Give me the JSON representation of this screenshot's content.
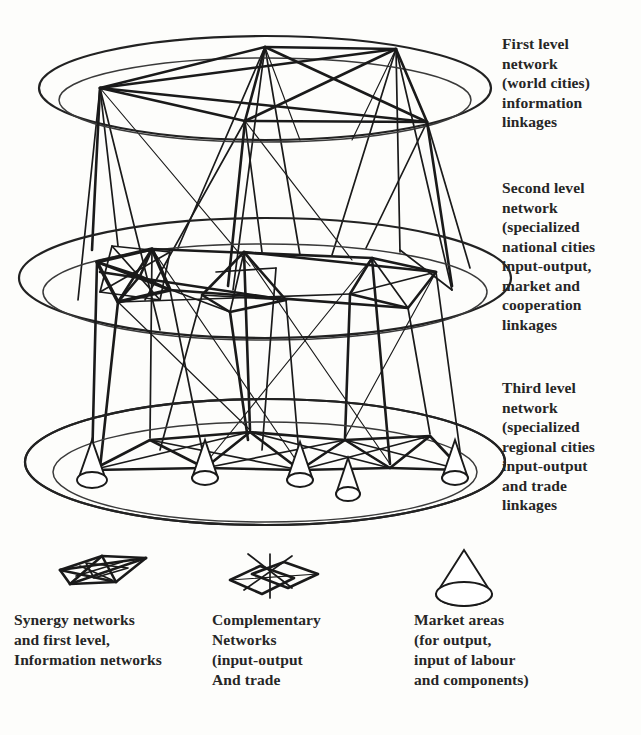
{
  "figure": {
    "background_color": "#fdfdfb",
    "ink_color": "#1a1a1a"
  },
  "levels": [
    {
      "id": "first",
      "label": "First level\nnetwork\n(world cities)\ninformation\nlinkages",
      "node_count": 5,
      "ellipse": {
        "cx": 265,
        "cy": 88,
        "rx": 226,
        "ry": 52
      },
      "nodes": [
        [
          100,
          88
        ],
        [
          265,
          47
        ],
        [
          396,
          49
        ],
        [
          245,
          121
        ],
        [
          427,
          122
        ]
      ],
      "edges": [
        [
          0,
          1
        ],
        [
          0,
          2
        ],
        [
          0,
          3
        ],
        [
          0,
          4
        ],
        [
          1,
          2
        ],
        [
          1,
          3
        ],
        [
          1,
          4
        ],
        [
          2,
          3
        ],
        [
          2,
          4
        ],
        [
          3,
          4
        ]
      ]
    },
    {
      "id": "second",
      "label": "Second level\nnetwork\n(specialized\nnational cities\ninput-output,\nmarket and\ncooperation\nlinkages",
      "node_count": 6,
      "ellipse": {
        "cx": 265,
        "cy": 278,
        "rx": 246,
        "ry": 60
      },
      "nodes": [
        [
          110,
          252
        ],
        [
          175,
          248
        ],
        [
          232,
          290
        ],
        [
          330,
          255
        ],
        [
          396,
          252
        ],
        [
          452,
          290
        ]
      ],
      "edges": [
        [
          0,
          1
        ],
        [
          0,
          2
        ],
        [
          1,
          2
        ],
        [
          1,
          3
        ],
        [
          2,
          3
        ],
        [
          2,
          4
        ],
        [
          3,
          4
        ],
        [
          3,
          5
        ],
        [
          4,
          5
        ],
        [
          0,
          3
        ],
        [
          1,
          4
        ],
        [
          2,
          5
        ]
      ]
    },
    {
      "id": "third",
      "label": "Third level\nnetwork\n(specialized\nregional cities\ninput-output\nand trade\nlinkages",
      "node_count": 9,
      "ellipse": {
        "cx": 265,
        "cy": 462,
        "rx": 240,
        "ry": 63
      },
      "nodes": [
        [
          92,
          470
        ],
        [
          150,
          440
        ],
        [
          205,
          468
        ],
        [
          250,
          432
        ],
        [
          300,
          470
        ],
        [
          345,
          440
        ],
        [
          390,
          468
        ],
        [
          430,
          436
        ],
        [
          462,
          470
        ]
      ],
      "edges": [
        [
          0,
          1
        ],
        [
          1,
          2
        ],
        [
          2,
          3
        ],
        [
          3,
          4
        ],
        [
          4,
          5
        ],
        [
          5,
          6
        ],
        [
          6,
          7
        ],
        [
          7,
          8
        ],
        [
          0,
          2
        ],
        [
          1,
          3
        ],
        [
          2,
          4
        ],
        [
          3,
          5
        ],
        [
          4,
          6
        ],
        [
          5,
          7
        ],
        [
          6,
          8
        ],
        [
          0,
          3
        ],
        [
          2,
          5
        ],
        [
          4,
          7
        ],
        [
          1,
          4
        ],
        [
          3,
          6
        ],
        [
          5,
          8
        ]
      ],
      "market_cone_positions": [
        [
          92,
          470
        ],
        [
          205,
          468
        ],
        [
          300,
          470
        ],
        [
          390,
          468
        ],
        [
          462,
          470
        ]
      ]
    }
  ],
  "inter_level_links": {
    "first_to_second": 12,
    "second_to_third": 18
  },
  "legend": {
    "items": [
      {
        "id": "synergy",
        "icon": "flattened-mesh-network-icon",
        "caption": "Synergy networks\nand first level,\nInformation networks"
      },
      {
        "id": "complementary",
        "icon": "overlapping-quadrilateral-network-icon",
        "caption": "Complementary\nNetworks\n(input-output\nAnd trade"
      },
      {
        "id": "market",
        "icon": "cone-icon",
        "caption": "Market areas\n(for output,\ninput of labour\nand components)"
      }
    ]
  }
}
